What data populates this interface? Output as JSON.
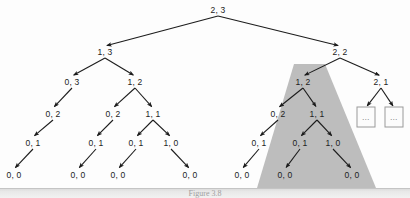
{
  "figure": {
    "caption": "Figure 3.8",
    "colors": {
      "background": "#fdfdfd",
      "node_text": "#1c1c1c",
      "edge": "#1c1c1c",
      "highlight_region": "#bdbdbd",
      "box_border": "#9a9a9a",
      "caption_text": "#9f9f9f"
    }
  },
  "highlight": {
    "name": "shaded-subtree-region",
    "shape": "trapezoid",
    "points": "294,64 325,64 376,188 257,188",
    "fill": "#bdbdbd"
  },
  "chart_data": {
    "type": "diagram",
    "subtype": "recursion-tree",
    "title": "Figure 3.8",
    "node_label_format": "n, m",
    "nodes": [
      {
        "id": "n0",
        "label": "2, 3",
        "x": 218,
        "y": 10,
        "depth": 0,
        "shaded": false
      },
      {
        "id": "n1",
        "label": "1, 3",
        "x": 105,
        "y": 52,
        "depth": 1,
        "shaded": false
      },
      {
        "id": "n2",
        "label": "2, 2",
        "x": 340,
        "y": 52,
        "depth": 1,
        "shaded": false
      },
      {
        "id": "n3",
        "label": "0, 3",
        "x": 72,
        "y": 82,
        "depth": 2,
        "shaded": false
      },
      {
        "id": "n4",
        "label": "1, 2",
        "x": 135,
        "y": 82,
        "depth": 2,
        "shaded": false
      },
      {
        "id": "n5",
        "label": "1, 2",
        "x": 303,
        "y": 82,
        "depth": 2,
        "shaded": true
      },
      {
        "id": "n6",
        "label": "2, 1",
        "x": 381,
        "y": 82,
        "depth": 2,
        "shaded": false
      },
      {
        "id": "n7",
        "label": "0, 2",
        "x": 53,
        "y": 114,
        "depth": 3,
        "shaded": false
      },
      {
        "id": "n8",
        "label": "0, 2",
        "x": 113,
        "y": 114,
        "depth": 3,
        "shaded": false
      },
      {
        "id": "n9",
        "label": "1, 1",
        "x": 153,
        "y": 114,
        "depth": 3,
        "shaded": false
      },
      {
        "id": "n10",
        "label": "0, 2",
        "x": 278,
        "y": 114,
        "depth": 3,
        "shaded": true
      },
      {
        "id": "n11",
        "label": "1, 1",
        "x": 317,
        "y": 114,
        "depth": 3,
        "shaded": true
      },
      {
        "id": "n12",
        "label": "0, 1",
        "x": 33,
        "y": 143,
        "depth": 4,
        "shaded": false
      },
      {
        "id": "n13",
        "label": "0, 1",
        "x": 96,
        "y": 143,
        "depth": 4,
        "shaded": false
      },
      {
        "id": "n14",
        "label": "0, 1",
        "x": 136,
        "y": 143,
        "depth": 4,
        "shaded": false
      },
      {
        "id": "n15",
        "label": "1, 0",
        "x": 171,
        "y": 143,
        "depth": 4,
        "shaded": false
      },
      {
        "id": "n16",
        "label": "0, 1",
        "x": 259,
        "y": 143,
        "depth": 4,
        "shaded": true
      },
      {
        "id": "n17",
        "label": "0, 1",
        "x": 300,
        "y": 143,
        "depth": 4,
        "shaded": true
      },
      {
        "id": "n18",
        "label": "1, 0",
        "x": 333,
        "y": 143,
        "depth": 4,
        "shaded": true
      },
      {
        "id": "n19",
        "label": "0, 0",
        "x": 14,
        "y": 175,
        "depth": 5,
        "shaded": false
      },
      {
        "id": "n20",
        "label": "0, 0",
        "x": 78,
        "y": 175,
        "depth": 5,
        "shaded": false
      },
      {
        "id": "n21",
        "label": "0, 0",
        "x": 118,
        "y": 175,
        "depth": 5,
        "shaded": false
      },
      {
        "id": "n22",
        "label": "0, 0",
        "x": 190,
        "y": 175,
        "depth": 5,
        "shaded": false
      },
      {
        "id": "n23",
        "label": "0, 0",
        "x": 242,
        "y": 175,
        "depth": 5,
        "shaded": true
      },
      {
        "id": "n24",
        "label": "0, 0",
        "x": 285,
        "y": 175,
        "depth": 5,
        "shaded": true
      },
      {
        "id": "n25",
        "label": "0, 0",
        "x": 352,
        "y": 175,
        "depth": 5,
        "shaded": true
      }
    ],
    "ellipsis_boxes": [
      {
        "id": "b1",
        "label": "...",
        "x": 366,
        "y": 117,
        "w": 17,
        "h": 19
      },
      {
        "id": "b2",
        "label": "...",
        "x": 394,
        "y": 117,
        "w": 17,
        "h": 19
      }
    ],
    "edges": [
      {
        "from": "n0",
        "to": "n1"
      },
      {
        "from": "n0",
        "to": "n2"
      },
      {
        "from": "n1",
        "to": "n3"
      },
      {
        "from": "n1",
        "to": "n4"
      },
      {
        "from": "n2",
        "to": "n5"
      },
      {
        "from": "n2",
        "to": "n6"
      },
      {
        "from": "n3",
        "to": "n7"
      },
      {
        "from": "n4",
        "to": "n8"
      },
      {
        "from": "n4",
        "to": "n9"
      },
      {
        "from": "n5",
        "to": "n10"
      },
      {
        "from": "n5",
        "to": "n11"
      },
      {
        "from": "n6",
        "to": "b1"
      },
      {
        "from": "n6",
        "to": "b2"
      },
      {
        "from": "n7",
        "to": "n12"
      },
      {
        "from": "n8",
        "to": "n13"
      },
      {
        "from": "n9",
        "to": "n14"
      },
      {
        "from": "n9",
        "to": "n15"
      },
      {
        "from": "n10",
        "to": "n16"
      },
      {
        "from": "n11",
        "to": "n17"
      },
      {
        "from": "n11",
        "to": "n18"
      },
      {
        "from": "n12",
        "to": "n19"
      },
      {
        "from": "n13",
        "to": "n20"
      },
      {
        "from": "n14",
        "to": "n21"
      },
      {
        "from": "n15",
        "to": "n22"
      },
      {
        "from": "n16",
        "to": "n23"
      },
      {
        "from": "n17",
        "to": "n24"
      },
      {
        "from": "n18",
        "to": "n25"
      }
    ]
  }
}
